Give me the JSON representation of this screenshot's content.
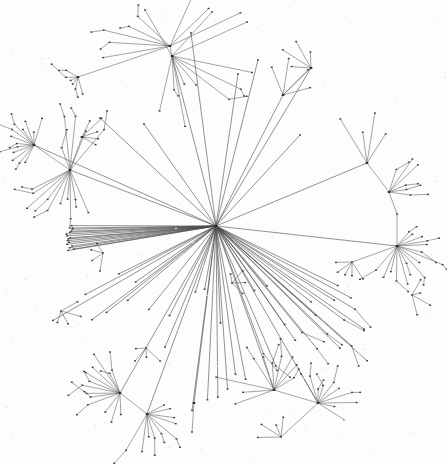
{
  "figure": {
    "title": "",
    "background_color": "#fdfdfd",
    "edge_color": "#5a5a5a",
    "node_color": "#3d3d3d",
    "hub_node_color": "#2a2a2a",
    "width": 447,
    "height": 464
  },
  "chart_data": {
    "type": "scatter",
    "title": "",
    "subtitle": "",
    "xlabel": "",
    "ylabel": "",
    "grid": false,
    "legend": "none",
    "layout": "force-directed radial network",
    "xlim": [
      0,
      447
    ],
    "ylim": [
      0,
      464
    ],
    "node_count": 308,
    "edge_count": 307,
    "nodes": [
      {
        "id": 0,
        "x": 216,
        "y": 226,
        "degree": 61,
        "role": "root-hub"
      },
      {
        "id": 1,
        "x": 70,
        "y": 170,
        "degree": 19,
        "role": "hub"
      },
      {
        "id": 2,
        "x": 34,
        "y": 145,
        "degree": 12,
        "role": "hub"
      },
      {
        "id": 3,
        "x": 172,
        "y": 56,
        "degree": 14,
        "role": "hub"
      },
      {
        "id": 4,
        "x": 170,
        "y": 46,
        "degree": 6,
        "role": "hub"
      },
      {
        "id": 5,
        "x": 397,
        "y": 246,
        "degree": 17,
        "role": "hub"
      },
      {
        "id": 6,
        "x": 120,
        "y": 393,
        "degree": 12,
        "role": "hub"
      },
      {
        "id": 7,
        "x": 147,
        "y": 414,
        "degree": 13,
        "role": "hub"
      },
      {
        "id": 8,
        "x": 274,
        "y": 390,
        "degree": 10,
        "role": "hub"
      },
      {
        "id": 9,
        "x": 318,
        "y": 403,
        "degree": 12,
        "role": "hub"
      },
      {
        "id": 10,
        "x": 367,
        "y": 163,
        "degree": 6,
        "role": "hub"
      },
      {
        "id": 11,
        "x": 389,
        "y": 192,
        "degree": 6,
        "role": "hub"
      },
      {
        "id": 12,
        "x": 283,
        "y": 95,
        "degree": 5,
        "role": "hub"
      },
      {
        "id": 13,
        "x": 311,
        "y": 68,
        "degree": 5,
        "role": "hub"
      },
      {
        "id": 14,
        "x": 78,
        "y": 77,
        "degree": 7,
        "role": "hub"
      },
      {
        "id": 15,
        "x": 82,
        "y": 137,
        "degree": 5,
        "role": "hub"
      }
    ]
  }
}
